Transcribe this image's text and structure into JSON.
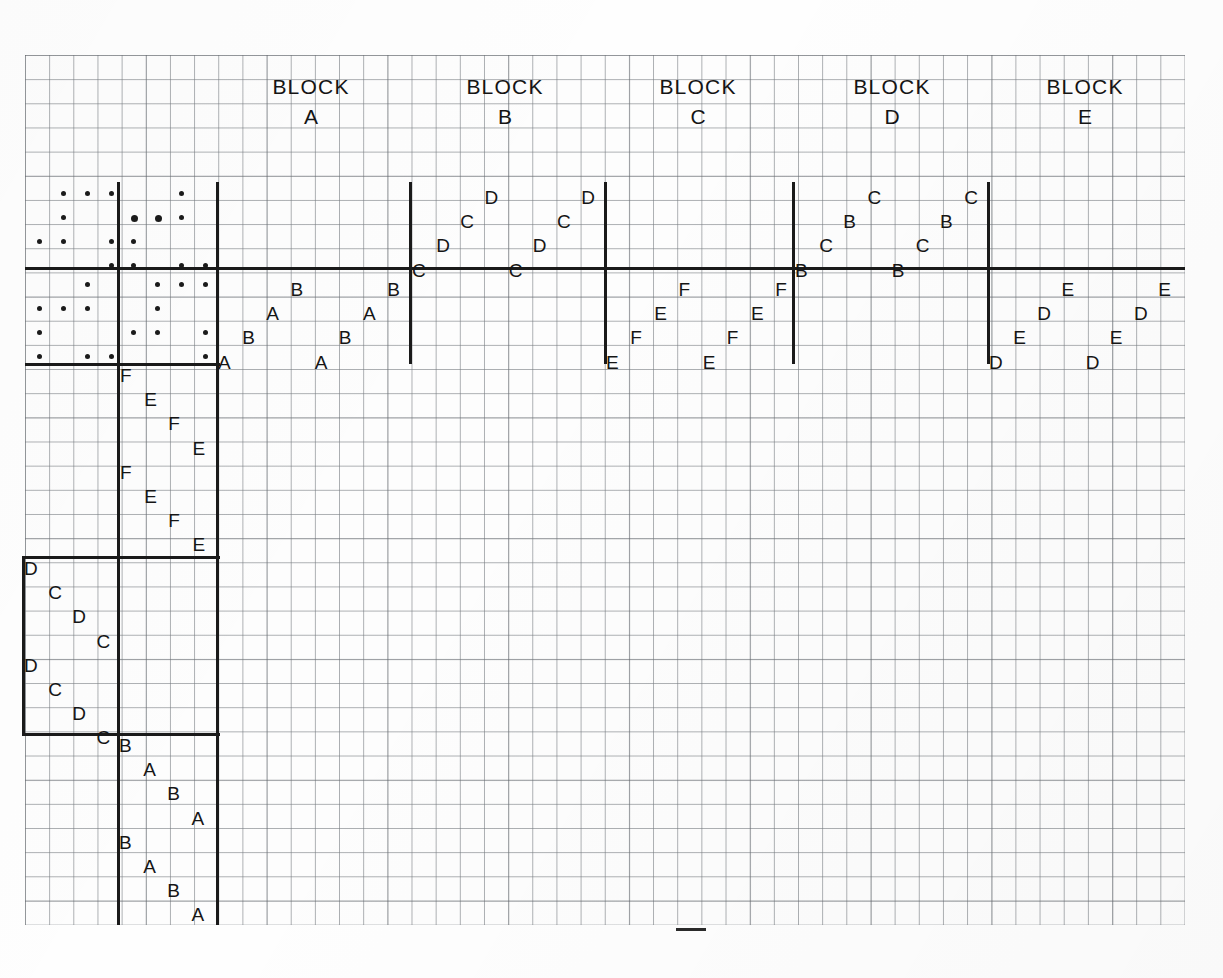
{
  "figure": {
    "kind": "experimental-block-design-layout",
    "medium": "graph-paper-scan"
  },
  "block_captions": [
    {
      "word": "BLOCK",
      "letter": "A"
    },
    {
      "word": "BLOCK",
      "letter": "B"
    },
    {
      "word": "BLOCK",
      "letter": "C"
    },
    {
      "word": "BLOCK",
      "letter": "D"
    },
    {
      "word": "BLOCK",
      "letter": "E"
    }
  ],
  "treatment_letters": {
    "block_a": [
      "A",
      "B",
      "A",
      "B",
      "B",
      "A",
      "B",
      "A"
    ],
    "block_b": [
      "C",
      "D",
      "C",
      "D",
      "C",
      "D",
      "C",
      "D"
    ],
    "block_c": [
      "E",
      "F",
      "E",
      "F",
      "E",
      "F",
      "E",
      "F"
    ],
    "block_d": [
      "B",
      "C",
      "B",
      "C",
      "B",
      "C",
      "B",
      "C"
    ],
    "block_e": [
      "D",
      "E",
      "D",
      "E",
      "D",
      "E",
      "D",
      "E"
    ],
    "column_upper": [
      "F",
      "E",
      "F",
      "E",
      "F",
      "E",
      "F",
      "E"
    ],
    "column_middle": [
      "D",
      "C",
      "D",
      "C",
      "D",
      "C",
      "D",
      "C"
    ],
    "column_lower": [
      "B",
      "A",
      "B",
      "A",
      "B",
      "A",
      "B",
      "A"
    ]
  },
  "cells": {
    "block_a": [
      {
        "letter": "A",
        "col": 0,
        "row": 3
      },
      {
        "letter": "B",
        "col": 1,
        "row": 2
      },
      {
        "letter": "A",
        "col": 2,
        "row": 1
      },
      {
        "letter": "B",
        "col": 3,
        "row": 0
      },
      {
        "letter": "A",
        "col": 4,
        "row": 3
      },
      {
        "letter": "B",
        "col": 5,
        "row": 2
      },
      {
        "letter": "A",
        "col": 6,
        "row": 1
      },
      {
        "letter": "B",
        "col": 7,
        "row": 0
      }
    ],
    "block_b": [
      {
        "letter": "C",
        "col": 0,
        "row": 3
      },
      {
        "letter": "D",
        "col": 1,
        "row": 2
      },
      {
        "letter": "C",
        "col": 2,
        "row": 1
      },
      {
        "letter": "D",
        "col": 3,
        "row": 0
      },
      {
        "letter": "C",
        "col": 4,
        "row": 3
      },
      {
        "letter": "D",
        "col": 5,
        "row": 2
      },
      {
        "letter": "C",
        "col": 6,
        "row": 1
      },
      {
        "letter": "D",
        "col": 7,
        "row": 0
      }
    ],
    "block_c": [
      {
        "letter": "E",
        "col": 0,
        "row": 3
      },
      {
        "letter": "F",
        "col": 1,
        "row": 2
      },
      {
        "letter": "E",
        "col": 2,
        "row": 1
      },
      {
        "letter": "F",
        "col": 3,
        "row": 0
      },
      {
        "letter": "E",
        "col": 4,
        "row": 3
      },
      {
        "letter": "F",
        "col": 5,
        "row": 2
      },
      {
        "letter": "E",
        "col": 6,
        "row": 1
      },
      {
        "letter": "F",
        "col": 7,
        "row": 0
      }
    ],
    "block_d": [
      {
        "letter": "B",
        "col": 0,
        "row": 3
      },
      {
        "letter": "C",
        "col": 1,
        "row": 2
      },
      {
        "letter": "B",
        "col": 2,
        "row": 1
      },
      {
        "letter": "C",
        "col": 3,
        "row": 0
      },
      {
        "letter": "B",
        "col": 4,
        "row": 3
      },
      {
        "letter": "C",
        "col": 5,
        "row": 2
      },
      {
        "letter": "B",
        "col": 6,
        "row": 1
      },
      {
        "letter": "C",
        "col": 7,
        "row": 0
      }
    ],
    "block_e": [
      {
        "letter": "D",
        "col": 0,
        "row": 3
      },
      {
        "letter": "E",
        "col": 1,
        "row": 2
      },
      {
        "letter": "D",
        "col": 2,
        "row": 1
      },
      {
        "letter": "E",
        "col": 3,
        "row": 0
      },
      {
        "letter": "D",
        "col": 4,
        "row": 3
      },
      {
        "letter": "E",
        "col": 5,
        "row": 2
      },
      {
        "letter": "D",
        "col": 6,
        "row": 1
      },
      {
        "letter": "E",
        "col": 7,
        "row": 0
      }
    ],
    "column_upper": [
      {
        "letter": "F",
        "col": 0,
        "row": 0
      },
      {
        "letter": "E",
        "col": 1,
        "row": 1
      },
      {
        "letter": "F",
        "col": 2,
        "row": 2
      },
      {
        "letter": "E",
        "col": 3,
        "row": 3
      },
      {
        "letter": "F",
        "col": 0,
        "row": 4
      },
      {
        "letter": "E",
        "col": 1,
        "row": 5
      },
      {
        "letter": "F",
        "col": 2,
        "row": 6
      },
      {
        "letter": "E",
        "col": 3,
        "row": 7
      }
    ],
    "column_middle": [
      {
        "letter": "D",
        "col": 0,
        "row": 0
      },
      {
        "letter": "C",
        "col": 1,
        "row": 1
      },
      {
        "letter": "D",
        "col": 2,
        "row": 2
      },
      {
        "letter": "C",
        "col": 3,
        "row": 3
      },
      {
        "letter": "D",
        "col": 0,
        "row": 4
      },
      {
        "letter": "C",
        "col": 1,
        "row": 5
      },
      {
        "letter": "D",
        "col": 2,
        "row": 6
      },
      {
        "letter": "C",
        "col": 3,
        "row": 7
      }
    ],
    "column_lower": [
      {
        "letter": "B",
        "col": 0,
        "row": 0
      },
      {
        "letter": "A",
        "col": 1,
        "row": 1
      },
      {
        "letter": "B",
        "col": 2,
        "row": 2
      },
      {
        "letter": "A",
        "col": 3,
        "row": 3
      },
      {
        "letter": "B",
        "col": 0,
        "row": 4
      },
      {
        "letter": "A",
        "col": 1,
        "row": 5
      },
      {
        "letter": "B",
        "col": 2,
        "row": 6
      },
      {
        "letter": "A",
        "col": 3,
        "row": 7
      }
    ]
  },
  "dot_plots": {
    "upper_left": [
      [
        1,
        0
      ],
      [
        2,
        0
      ],
      [
        3,
        0
      ],
      [
        1,
        1
      ],
      [
        0,
        2
      ],
      [
        1,
        2
      ],
      [
        3,
        2
      ],
      [
        3,
        3
      ]
    ],
    "upper_right": [
      [
        2,
        0
      ],
      [
        0,
        1
      ],
      [
        1,
        1
      ],
      [
        2,
        1
      ],
      [
        0,
        2
      ],
      [
        0,
        3
      ],
      [
        2,
        3
      ],
      [
        3,
        3
      ]
    ],
    "lower_left": [
      [
        2,
        0
      ],
      [
        0,
        1
      ],
      [
        1,
        1
      ],
      [
        2,
        1
      ],
      [
        0,
        2
      ],
      [
        0,
        3
      ],
      [
        2,
        3
      ],
      [
        3,
        3
      ]
    ],
    "lower_right": [
      [
        1,
        0
      ],
      [
        2,
        0
      ],
      [
        3,
        0
      ],
      [
        1,
        1
      ],
      [
        0,
        2
      ],
      [
        1,
        2
      ],
      [
        3,
        2
      ],
      [
        3,
        3
      ]
    ]
  },
  "geometry": {
    "cell_px": 24.17,
    "paper_left": 25,
    "paper_top": 55,
    "paper_width": 1160,
    "paper_height": 870
  },
  "colors": {
    "grid_fine": "#787d82",
    "grid_coarse": "#5a5f64",
    "ink": "#151515",
    "paper": "#fdfdfd"
  }
}
